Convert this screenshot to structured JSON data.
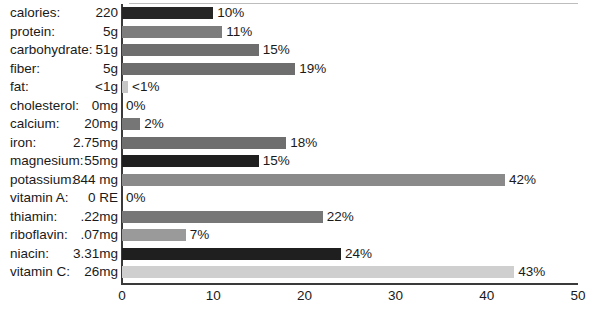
{
  "chart_data": {
    "type": "bar",
    "orientation": "horizontal",
    "title": "",
    "xlabel": "",
    "ylabel": "",
    "xlim": [
      0,
      50
    ],
    "grid": false,
    "legend": null,
    "axis_ticks": [
      "0",
      "10",
      "20",
      "30",
      "40",
      "50"
    ],
    "axis_tick_values": [
      0,
      10,
      20,
      30,
      40,
      50
    ],
    "categories": [
      "calories:",
      "protein:",
      "carbohydrate:",
      "fiber:",
      "fat:",
      "cholesterol:",
      "calcium:",
      "iron:",
      "magnesium:",
      "potassium:",
      "vitamin A:",
      "thiamin:",
      "riboflavin:",
      "niacin:",
      "vitamin C:"
    ],
    "amounts": [
      "220",
      "5g",
      "51g",
      "5g",
      "<1g",
      "0mg",
      "20mg",
      "2.75mg",
      "55mg",
      "844 mg",
      "0 RE",
      ".22mg",
      ".07mg",
      "3.31mg",
      "26mg"
    ],
    "values": [
      10,
      11,
      15,
      19,
      0.4,
      0,
      2,
      18,
      15,
      42,
      0,
      22,
      7,
      24,
      43
    ],
    "value_labels": [
      "10%",
      "11%",
      "15%",
      "19%",
      "<1%",
      "0%",
      "2%",
      "18%",
      "15%",
      "42%",
      "0%",
      "22%",
      "7%",
      "24%",
      "43%"
    ],
    "bar_colors": [
      "#262626",
      "#7d7d7d",
      "#6e6e6e",
      "#6e6e6e",
      "#c6c6c6",
      "#ffffff",
      "#767676",
      "#6e6e6e",
      "#1f1f1f",
      "#8a8a8a",
      "#ffffff",
      "#777777",
      "#9a9a9a",
      "#1f1f1f",
      "#cfcfcf"
    ],
    "axis_color": "#3a3a3a",
    "background": "#ffffff",
    "text_color": "#1a1a1a"
  }
}
